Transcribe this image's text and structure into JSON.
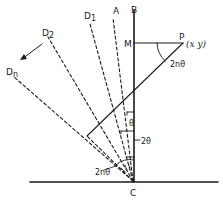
{
  "diagram": {
    "labels": {
      "A": "A",
      "B": "B",
      "C": "C",
      "D1": "D",
      "D1_sub": "1",
      "D2": "D",
      "D2_sub": "2",
      "Dn": "D",
      "Dn_sub": "n",
      "M": "M",
      "P": "P",
      "P_coords": "(x y)",
      "angle_P": "2nθ",
      "angle_theta": "θ",
      "angle_2theta": "2θ",
      "angle_2ntheta": "2nθ"
    },
    "colors": {
      "stroke": "#1a1a1a",
      "background": "#ffffff"
    }
  }
}
